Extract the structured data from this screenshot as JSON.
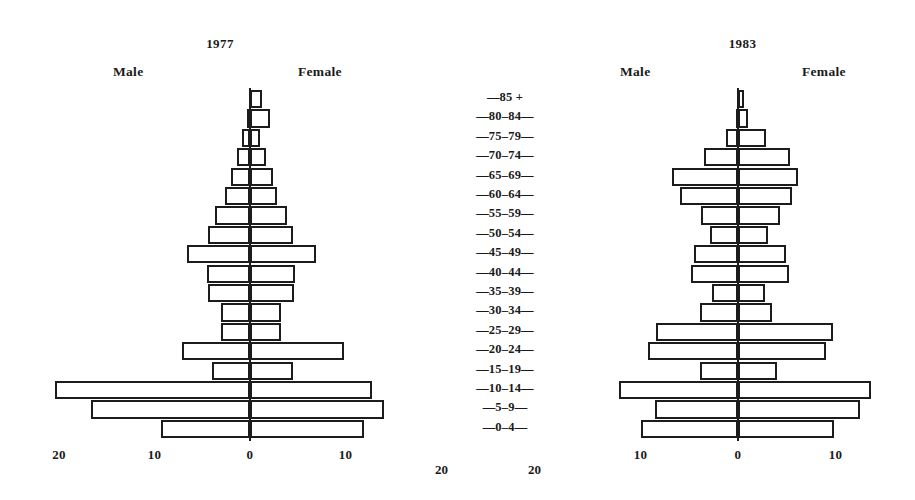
{
  "figure": {
    "age_groups": [
      "85 +",
      "80-84",
      "75-79",
      "70-74",
      "65-69",
      "60-64",
      "55-59",
      "50-54",
      "45-49",
      "40-44",
      "35-39",
      "30-34",
      "25-29",
      "20-24",
      "15-19",
      "10-14",
      "5-9",
      "0-4"
    ],
    "age_labels": [
      "—85 +",
      "—80–84—",
      "—75–79—",
      "—70–74—",
      "—65–69—",
      "—60–64—",
      "—55–59—",
      "—50–54—",
      "—45–49—",
      "—40–44—",
      "—35–39—",
      "—30–34—",
      "—25–29—",
      "—20–24—",
      "—15–19—",
      "—10–14—",
      "—5–9—",
      "—0–4—"
    ],
    "male_label": "Male",
    "female_label": "Female",
    "mid_tick_left": "20",
    "mid_tick_right": "20"
  },
  "chart_data": [
    {
      "type": "bar",
      "title": "1977",
      "subtitle": "",
      "xlabel": "",
      "ylabel": "",
      "orientation": "population-pyramid",
      "categories": [
        "85 +",
        "80-84",
        "75-79",
        "70-74",
        "65-69",
        "60-64",
        "55-59",
        "50-54",
        "45-49",
        "40-44",
        "35-39",
        "30-34",
        "25-29",
        "20-24",
        "15-19",
        "10-14",
        "5-9",
        "0-4"
      ],
      "xticks": [
        "20",
        "10",
        "0",
        "10"
      ],
      "xtick_values": [
        -20,
        -10,
        0,
        10
      ],
      "xlim": [
        -21,
        16
      ],
      "grid": false,
      "legend": "none",
      "series": [
        {
          "name": "Male",
          "values": [
            0.0,
            0.3,
            0.8,
            1.4,
            2.0,
            2.6,
            3.7,
            4.4,
            6.6,
            4.5,
            4.4,
            3.0,
            3.0,
            7.1,
            4.0,
            20.4,
            16.7,
            9.3
          ]
        },
        {
          "name": "Female",
          "values": [
            1.3,
            2.1,
            1.0,
            1.7,
            2.4,
            2.8,
            3.9,
            4.5,
            6.9,
            4.7,
            4.6,
            3.2,
            3.2,
            9.8,
            4.5,
            12.8,
            14.0,
            11.9
          ]
        }
      ]
    },
    {
      "type": "bar",
      "title": "1983",
      "subtitle": "",
      "xlabel": "",
      "ylabel": "",
      "orientation": "population-pyramid",
      "categories": [
        "85 +",
        "80-84",
        "75-79",
        "70-74",
        "65-69",
        "60-64",
        "55-59",
        "50-54",
        "45-49",
        "40-44",
        "35-39",
        "30-34",
        "25-29",
        "20-24",
        "15-19",
        "10-14",
        "5-9",
        "0-4"
      ],
      "xticks": [
        "10",
        "0",
        "10"
      ],
      "xtick_values": [
        -10,
        0,
        10
      ],
      "xlim": [
        -14,
        14
      ],
      "grid": false,
      "legend": "none",
      "series": [
        {
          "name": "Male",
          "values": [
            0.0,
            0.2,
            1.2,
            3.5,
            6.8,
            5.9,
            3.8,
            2.9,
            4.5,
            4.8,
            2.7,
            3.9,
            8.4,
            9.2,
            3.9,
            12.2,
            8.5,
            10.0
          ]
        },
        {
          "name": "Female",
          "values": [
            0.6,
            1.0,
            2.9,
            5.3,
            6.2,
            5.5,
            4.3,
            3.1,
            4.9,
            5.2,
            2.8,
            3.5,
            9.7,
            9.0,
            4.0,
            13.6,
            12.5,
            9.8
          ]
        }
      ]
    }
  ]
}
